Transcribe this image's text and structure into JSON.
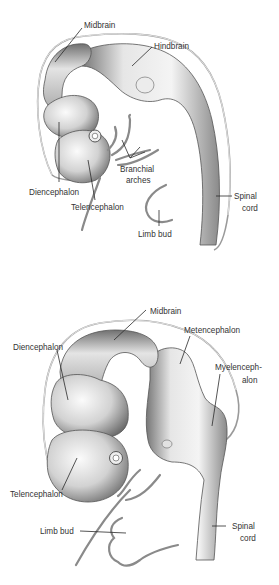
{
  "figure": {
    "panels": [
      {
        "id": "top",
        "description": "Early embryonic brain with three primary vesicles",
        "labels": {
          "midbrain": "Midbrain",
          "hindbrain": "Hindbrain",
          "diencephalon": "Diencephalon",
          "telencephalon": "Telencephalon",
          "branchial_arches_1": "Branchial",
          "branchial_arches_2": "arches",
          "limb_bud": "Limb bud",
          "spinal_cord_1": "Spinal",
          "spinal_cord_2": "cord"
        }
      },
      {
        "id": "bottom",
        "description": "Later embryonic brain with five secondary vesicles",
        "labels": {
          "midbrain": "Midbrain",
          "diencephalon": "Diencephalon",
          "metencephalon": "Metencephalon",
          "myelencephalon_1": "Myelenceph-",
          "myelencephalon_2": "alon",
          "telencephalon": "Telencephalon",
          "limb_bud": "Limb bud",
          "spinal_cord_1": "Spinal",
          "spinal_cord_2": "cord"
        }
      }
    ],
    "colors": {
      "tissue_light": "#f2f2f2",
      "tissue_mid": "#c8c8c8",
      "tissue_dark": "#6e6e6e",
      "label_text": "#333333",
      "leader_line": "#2a2a2a"
    }
  }
}
